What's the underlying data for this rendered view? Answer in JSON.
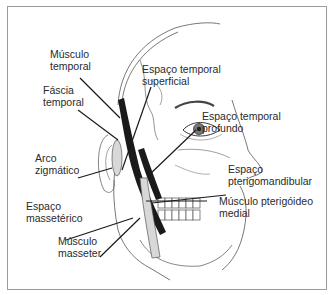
{
  "diagram": {
    "type": "anatomical-illustration",
    "labels": [
      {
        "id": "musculo-temporal",
        "lines": [
          "Músculo",
          "temporal"
        ]
      },
      {
        "id": "fascia-temporal",
        "lines": [
          "Fáscia",
          "temporal"
        ]
      },
      {
        "id": "arco-zigmatico",
        "lines": [
          "Arco",
          "zigmático"
        ]
      },
      {
        "id": "espaco-masseterico",
        "lines": [
          "Espaço",
          "massetérico"
        ]
      },
      {
        "id": "musculo-masseter",
        "lines": [
          "Músculo",
          "masseter"
        ]
      },
      {
        "id": "espaco-temporal-superficial",
        "lines": [
          "Espaço temporal",
          "superficial"
        ]
      },
      {
        "id": "espaco-temporal-profundo",
        "lines": [
          "Espaço temporal",
          "profundo"
        ]
      },
      {
        "id": "espaco-pterigomandibular",
        "lines": [
          "Espaço",
          "pterigomandibular"
        ]
      },
      {
        "id": "musculo-pterigoideo-medial",
        "lines": [
          "Músculo pterigóideo",
          "medial"
        ]
      }
    ],
    "colors": {
      "line": "#1a1a1a",
      "text": "#2a2a2a",
      "frame": "#9a9a9a",
      "bone_fill": "#d8d8d8"
    }
  }
}
